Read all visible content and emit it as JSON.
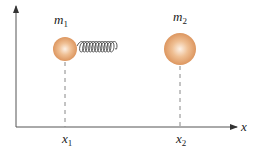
{
  "diagram": {
    "title": "",
    "axes": {
      "x_label": "x",
      "has_y_axis": true,
      "color": "#555555"
    },
    "masses": [
      {
        "id": "m1",
        "label": "m",
        "subscript": "1",
        "position_label": "x",
        "position_subscript": "1",
        "color": "#e0a070"
      },
      {
        "id": "m2",
        "label": "m",
        "subscript": "2",
        "position_label": "x",
        "position_subscript": "2",
        "color": "#e0a070"
      }
    ],
    "spring": {
      "connects": [
        "m1",
        "m2"
      ],
      "color": "#444444"
    },
    "colors": {
      "mass_fill": "#e3a36e",
      "mass_highlight": "#fbe6d4",
      "axis": "#555555",
      "dashed": "#888888"
    }
  }
}
